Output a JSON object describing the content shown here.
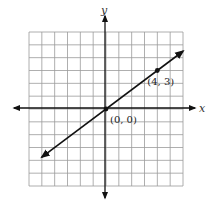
{
  "chart_data": {
    "type": "line",
    "title": "",
    "xlabel": "x",
    "ylabel": "y",
    "xlim": [
      -6,
      6
    ],
    "ylim": [
      -6,
      6
    ],
    "grid": true,
    "grid_step": 1,
    "series": [
      {
        "name": "line through origin",
        "equation": "y = 3/4 x",
        "slope": 0.75,
        "intercept": 0,
        "x": [
          -5,
          6
        ],
        "y": [
          -3.75,
          4.5
        ],
        "arrows": "both"
      }
    ],
    "points": [
      {
        "x": 0,
        "y": 0,
        "label": "(0, 0)"
      },
      {
        "x": 4,
        "y": 3,
        "label": "(4, 3)"
      }
    ]
  },
  "labels": {
    "x_axis": "x",
    "y_axis": "y",
    "origin": "(0, 0)",
    "point": "(4, 3)"
  }
}
